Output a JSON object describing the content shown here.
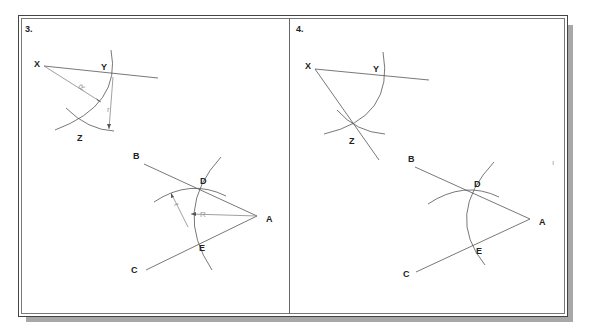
{
  "figure": {
    "colors": {
      "background": "#ffffff",
      "frame": "#444444",
      "shadow": "#a8a8a8",
      "stroke": "#555555",
      "dim_text": "#999999"
    },
    "panels": [
      {
        "number": "3.",
        "step1": {
          "labels": {
            "x": "X",
            "y": "Y",
            "z": "Z"
          },
          "dimension_labels": {
            "radius_big": "R",
            "radius_small": "r"
          }
        },
        "step2": {
          "labels": {
            "a": "A",
            "b": "B",
            "c": "C",
            "d": "D",
            "e": "E"
          },
          "dimension_labels": {
            "radius_big": "R",
            "radius_small": "r"
          }
        }
      },
      {
        "number": "4.",
        "step1": {
          "labels": {
            "x": "X",
            "y": "Y",
            "z": "Z"
          }
        },
        "step2": {
          "labels": {
            "a": "A",
            "b": "B",
            "c": "C",
            "d": "D",
            "e": "E"
          }
        }
      }
    ],
    "stray_mark": "ı"
  }
}
